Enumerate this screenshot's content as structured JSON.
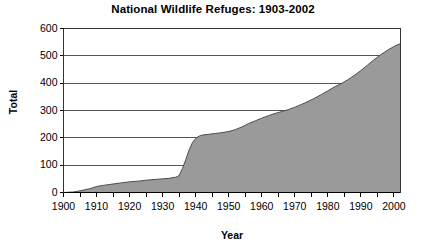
{
  "chart_data": {
    "type": "area",
    "title": "National Wildlife Refuges: 1903-2002",
    "xlabel": "Year",
    "ylabel": "Total",
    "xlim": [
      1900,
      2002
    ],
    "ylim": [
      0,
      600
    ],
    "grid": true,
    "legend": null,
    "ytick_labels": [
      "600",
      "500",
      "400",
      "300",
      "200",
      "100",
      "0"
    ],
    "ytick_values": [
      600,
      500,
      400,
      300,
      200,
      100,
      0
    ],
    "xtick_labels": [
      "1900",
      "1910",
      "1920",
      "1930",
      "1940",
      "1950",
      "1960",
      "1970",
      "1980",
      "1990",
      "2000"
    ],
    "xtick_values": [
      1900,
      1910,
      1920,
      1930,
      1940,
      1950,
      1960,
      1970,
      1980,
      1990,
      2000
    ],
    "minor_tick_interval": 5,
    "series": [
      {
        "name": "Total refuges",
        "fill_color": "#9a9a9a",
        "line_color": "#4d4d4d",
        "x": [
          1900,
          1903,
          1905,
          1908,
          1910,
          1912,
          1915,
          1918,
          1920,
          1923,
          1925,
          1928,
          1930,
          1932,
          1934,
          1935,
          1936,
          1937,
          1938,
          1939,
          1940,
          1941,
          1942,
          1944,
          1946,
          1948,
          1950,
          1952,
          1954,
          1956,
          1958,
          1960,
          1962,
          1964,
          1966,
          1968,
          1970,
          1972,
          1974,
          1976,
          1978,
          1980,
          1982,
          1984,
          1986,
          1988,
          1990,
          1992,
          1994,
          1996,
          1998,
          2000,
          2002
        ],
        "y": [
          0,
          2,
          6,
          14,
          22,
          26,
          31,
          36,
          39,
          42,
          45,
          48,
          50,
          52,
          56,
          62,
          88,
          120,
          155,
          182,
          198,
          206,
          210,
          213,
          216,
          219,
          223,
          230,
          240,
          252,
          262,
          272,
          281,
          289,
          296,
          303,
          312,
          322,
          333,
          345,
          358,
          372,
          386,
          398,
          412,
          428,
          446,
          466,
          486,
          504,
          520,
          534,
          545
        ]
      }
    ]
  }
}
